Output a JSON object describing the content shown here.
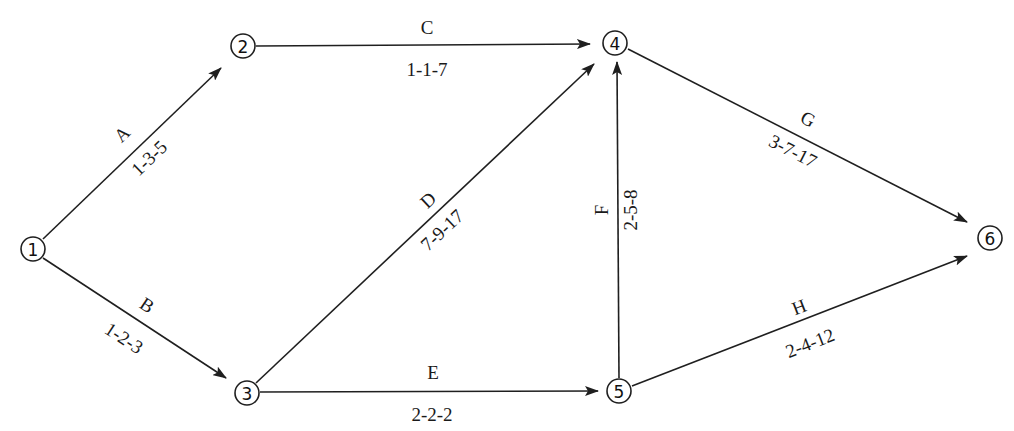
{
  "diagram": {
    "type": "activity-on-arrow network (PERT)",
    "caption_fragment": "",
    "nodes": [
      {
        "id": "1",
        "label": "1",
        "x": 33,
        "y": 249
      },
      {
        "id": "2",
        "label": "2",
        "x": 243,
        "y": 46
      },
      {
        "id": "3",
        "label": "3",
        "x": 247,
        "y": 393
      },
      {
        "id": "4",
        "label": "4",
        "x": 615,
        "y": 43
      },
      {
        "id": "5",
        "label": "5",
        "x": 619,
        "y": 391
      },
      {
        "id": "6",
        "label": "6",
        "x": 990,
        "y": 238
      }
    ],
    "edges": [
      {
        "activity": "A",
        "from": "1",
        "to": "2",
        "times": "1-3-5",
        "x1": 43,
        "y1": 239,
        "x2": 221,
        "y2": 68,
        "name_pos": [
          122,
          134
        ],
        "times_pos": [
          149,
          158
        ],
        "angle": -43.8
      },
      {
        "activity": "B",
        "from": "1",
        "to": "3",
        "times": "1-2-3",
        "x1": 43,
        "y1": 258,
        "x2": 226,
        "y2": 378,
        "name_pos": [
          147,
          305
        ],
        "times_pos": [
          124,
          338
        ],
        "angle": 33.3
      },
      {
        "activity": "C",
        "from": "2",
        "to": "4",
        "times": "1-1-7",
        "x1": 256,
        "y1": 46,
        "x2": 590,
        "y2": 44,
        "name_pos": [
          427,
          27
        ],
        "times_pos": [
          427,
          69
        ],
        "angle": 0
      },
      {
        "activity": "D",
        "from": "3",
        "to": "4",
        "times": "7-9-17",
        "x1": 256,
        "y1": 383,
        "x2": 594,
        "y2": 64,
        "name_pos": [
          428,
          200
        ],
        "times_pos": [
          442,
          230
        ],
        "angle": -43.3
      },
      {
        "activity": "E",
        "from": "3",
        "to": "5",
        "times": "2-2-2",
        "x1": 260,
        "y1": 392,
        "x2": 598,
        "y2": 391,
        "name_pos": [
          433,
          372
        ],
        "times_pos": [
          432,
          414
        ],
        "angle": 0
      },
      {
        "activity": "F",
        "from": "5",
        "to": "4",
        "times": "2-5-8",
        "x1": 619,
        "y1": 378,
        "x2": 617,
        "y2": 62,
        "name_pos": [
          601,
          210
        ],
        "times_pos": [
          630,
          210
        ],
        "angle": -90
      },
      {
        "activity": "G",
        "from": "4",
        "to": "6",
        "times": "3-7-17",
        "x1": 628,
        "y1": 49,
        "x2": 967,
        "y2": 222,
        "name_pos": [
          808,
          119
        ],
        "times_pos": [
          793,
          151
        ],
        "angle": 27
      },
      {
        "activity": "H",
        "from": "5",
        "to": "6",
        "times": "2-4-12",
        "x1": 632,
        "y1": 386,
        "x2": 967,
        "y2": 256,
        "name_pos": [
          799,
          307
        ],
        "times_pos": [
          810,
          343
        ],
        "angle": -21.2
      }
    ],
    "colors": {
      "line": "#1f1f1f",
      "text": "#1a1a1a",
      "background": "#ffffff"
    }
  }
}
